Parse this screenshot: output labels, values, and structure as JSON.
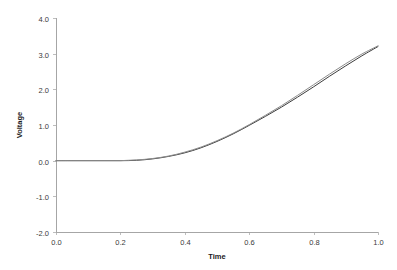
{
  "chart_data": {
    "type": "line",
    "title": "",
    "xlabel": "Time",
    "ylabel": "Voltage",
    "xlim": [
      0.0,
      1.0
    ],
    "ylim": [
      -2.0,
      4.0
    ],
    "grid": false,
    "legend": "none",
    "xticks": [
      "0.0",
      "0.2",
      "0.4",
      "0.6",
      "0.8",
      "1.0"
    ],
    "xtick_values": [
      0.0,
      0.2,
      0.4,
      0.6,
      0.8,
      1.0
    ],
    "yticks": [
      "4.0",
      "3.0",
      "2.0",
      "1.0",
      "0.0",
      "-1.0",
      "-2.0"
    ],
    "ytick_values": [
      4.0,
      3.0,
      2.0,
      1.0,
      0.0,
      -1.0,
      -2.0
    ],
    "x": [
      0.0,
      0.05,
      0.1,
      0.15,
      0.2,
      0.25,
      0.3,
      0.35,
      0.4,
      0.45,
      0.5,
      0.55,
      0.6,
      0.65,
      0.7,
      0.75,
      0.8,
      0.85,
      0.9,
      0.95,
      1.0
    ],
    "series": [
      {
        "name": "series-1",
        "color": "#3c3c3c",
        "values": [
          0.0,
          0.0,
          0.0,
          0.0,
          0.0,
          0.01,
          0.05,
          0.12,
          0.22,
          0.36,
          0.54,
          0.75,
          0.99,
          1.24,
          1.5,
          1.78,
          2.07,
          2.37,
          2.66,
          2.94,
          3.2
        ]
      },
      {
        "name": "series-2",
        "color": "#8c8c8c",
        "values": [
          0.0,
          0.0,
          0.0,
          0.0,
          0.0,
          0.02,
          0.06,
          0.13,
          0.24,
          0.38,
          0.56,
          0.77,
          1.01,
          1.27,
          1.54,
          1.83,
          2.13,
          2.43,
          2.72,
          2.99,
          3.22
        ]
      }
    ]
  },
  "plot": {
    "left": 56,
    "right": 378,
    "top": 18,
    "bottom": 232
  }
}
